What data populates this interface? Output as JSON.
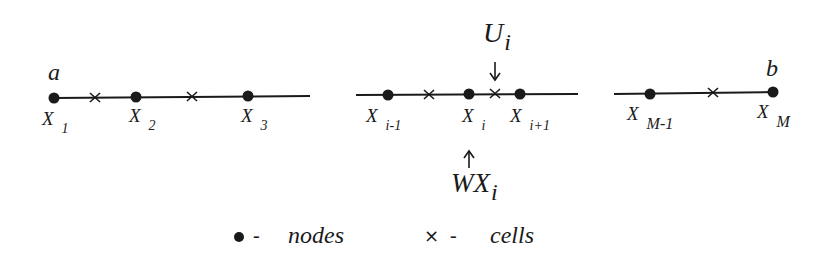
{
  "diagram": {
    "segments": [
      {
        "id": "left",
        "line": {
          "x1": 53,
          "x2": 310,
          "y": 97
        },
        "endpoint_label": {
          "text": "a",
          "x": 49,
          "y": 79
        },
        "nodes": [
          {
            "x": 54,
            "label": "X",
            "sub": "1"
          },
          {
            "x": 136,
            "label": "X",
            "sub": "2"
          },
          {
            "x": 248,
            "label": "X",
            "sub": "3"
          }
        ],
        "cells": [
          {
            "x": 95
          },
          {
            "x": 192
          }
        ]
      },
      {
        "id": "middle",
        "line": {
          "x1": 356,
          "x2": 578,
          "y": 94
        },
        "nodes": [
          {
            "x": 388,
            "label": "X",
            "sub": "i-1"
          },
          {
            "x": 469,
            "label": "X",
            "sub": "i"
          },
          {
            "x": 520,
            "label": "X",
            "sub": "i+1"
          }
        ],
        "cells": [
          {
            "x": 428
          },
          {
            "x": 495
          }
        ]
      },
      {
        "id": "right",
        "line": {
          "x1": 614,
          "x2": 775,
          "y": 93
        },
        "endpoint_label": {
          "text": "b",
          "x": 770,
          "y": 75
        },
        "nodes": [
          {
            "x": 650,
            "label": "X",
            "sub": "M-1"
          },
          {
            "x": 773,
            "label": "X",
            "sub": "M"
          }
        ],
        "cells": [
          {
            "x": 712
          }
        ]
      }
    ],
    "annotations": {
      "top": {
        "main": "U",
        "sub": "i",
        "arrow": "down",
        "x": 495
      },
      "bottom": {
        "main": "WX",
        "sub": "i",
        "arrow": "up",
        "x": 469
      }
    },
    "legend": {
      "nodes_symbol": "•",
      "nodes_dash": "-",
      "nodes_label": "nodes",
      "cells_symbol": "×",
      "cells_dash": "-",
      "cells_label": "cells"
    },
    "colors": {
      "ink": "#1a1a1a",
      "background": "#ffffff"
    }
  }
}
